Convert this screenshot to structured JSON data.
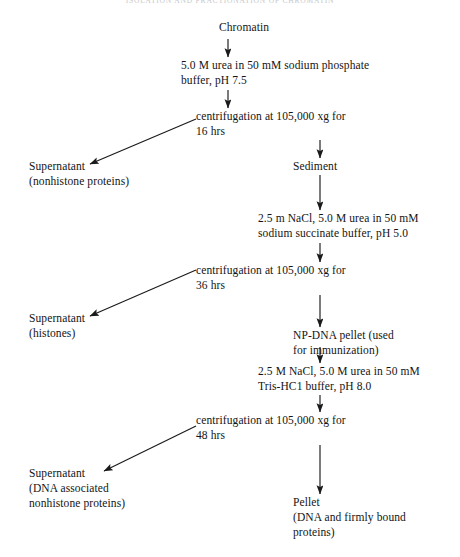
{
  "figure": {
    "top_caption": "ISOLATION AND FRACTIONATION OF CHROMATIN"
  },
  "nodes": {
    "chromatin": "Chromatin",
    "buffer1": "5.0 M urea in 50 mM sodium phosphate\nbuffer, pH 7.5",
    "centrifuge1": "centrifugation at 105,000 xg for\n16 hrs",
    "supernatant1": "Supernatant\n(nonhistone proteins)",
    "sediment": "Sediment",
    "buffer2": "2.5 m NaCl, 5.0 M urea in 50 mM\nsodium succinate buffer, pH 5.0",
    "centrifuge2": "centrifugation at 105,000 xg for\n36 hrs",
    "supernatant2": "Supernatant\n(histones)",
    "np_dna_pellet": "NP-DNA pellet (used\nfor immunization)",
    "buffer3": "2.5 M NaCl, 5.0 M urea in 50 mM\nTris-HC1 buffer, pH 8.0",
    "centrifuge3": "centrifugation at 105,000 xg for\n48 hrs",
    "supernatant3": "Supernatant\n(DNA associated\nnonhistone proteins)",
    "pellet": "Pellet\n(DNA and firmly bound\nproteins)"
  },
  "style": {
    "line_color": "#1a1a1a",
    "background": "#ffffff",
    "text_color": "#141414"
  }
}
